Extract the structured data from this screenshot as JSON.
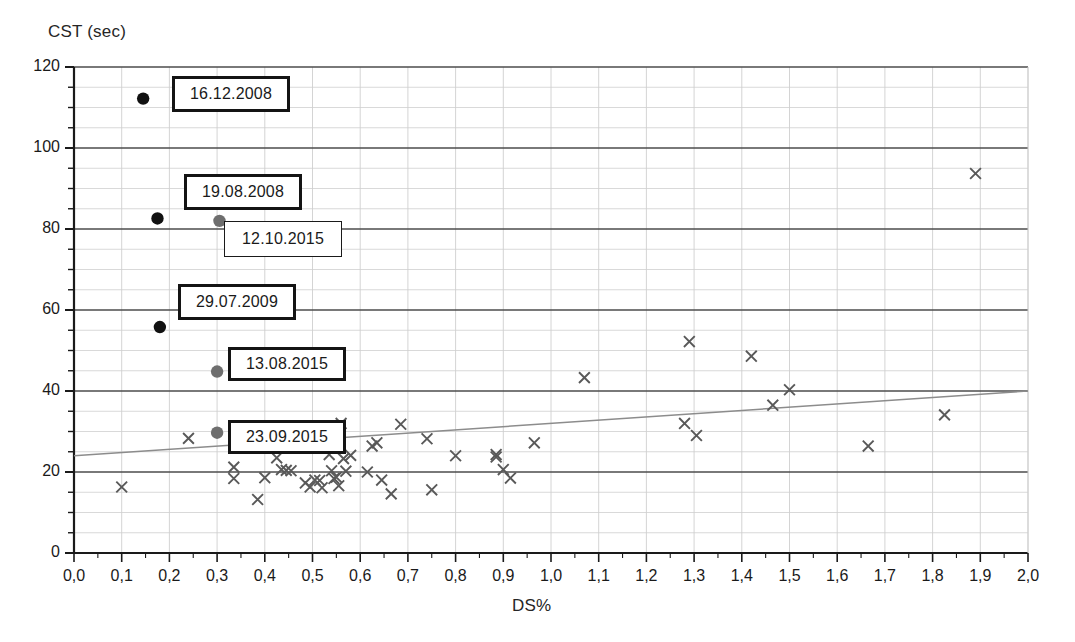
{
  "chart_data": {
    "type": "scatter",
    "title": "",
    "xlabel": "DS%",
    "ylabel": "CST (sec)",
    "xlim": [
      0.0,
      2.0
    ],
    "ylim": [
      0,
      120
    ],
    "x_major_step": 0.1,
    "y_major_step": 20,
    "y_minor_step": 5,
    "grid": true,
    "legend_position": "none",
    "xticks": [
      "0,0",
      "0,1",
      "0,2",
      "0,3",
      "0,4",
      "0,5",
      "0,6",
      "0,7",
      "0,8",
      "0,9",
      "1,0",
      "1,1",
      "1,2",
      "1,3",
      "1,4",
      "1,5",
      "1,6",
      "1,7",
      "1,8",
      "1,9",
      "2,0"
    ],
    "yticks": [
      "0",
      "20",
      "40",
      "60",
      "80",
      "100",
      "120"
    ],
    "series": [
      {
        "name": "measurements",
        "marker": "x",
        "color": "#595959",
        "points": [
          [
            0.1,
            16.3
          ],
          [
            0.24,
            28.3
          ],
          [
            0.335,
            21.2
          ],
          [
            0.335,
            18.4
          ],
          [
            0.385,
            13.2
          ],
          [
            0.4,
            18.6
          ],
          [
            0.425,
            23.5
          ],
          [
            0.435,
            20.6
          ],
          [
            0.445,
            20.4
          ],
          [
            0.455,
            20.3
          ],
          [
            0.485,
            17.3
          ],
          [
            0.495,
            16.3
          ],
          [
            0.505,
            18.0
          ],
          [
            0.515,
            17.9
          ],
          [
            0.52,
            16.1
          ],
          [
            0.535,
            24.3
          ],
          [
            0.54,
            20.3
          ],
          [
            0.545,
            18.4
          ],
          [
            0.55,
            18.7
          ],
          [
            0.555,
            16.6
          ],
          [
            0.56,
            32.0
          ],
          [
            0.565,
            23.3
          ],
          [
            0.57,
            20.2
          ],
          [
            0.58,
            24.1
          ],
          [
            0.615,
            20.0
          ],
          [
            0.625,
            26.4
          ],
          [
            0.635,
            27.2
          ],
          [
            0.645,
            18.0
          ],
          [
            0.665,
            14.6
          ],
          [
            0.685,
            31.8
          ],
          [
            0.74,
            28.2
          ],
          [
            0.75,
            15.6
          ],
          [
            0.8,
            24.0
          ],
          [
            0.885,
            24.3
          ],
          [
            0.885,
            23.7
          ],
          [
            0.9,
            20.6
          ],
          [
            0.915,
            18.5
          ],
          [
            0.965,
            27.2
          ],
          [
            1.07,
            43.3
          ],
          [
            1.28,
            32.0
          ],
          [
            1.305,
            29.0
          ],
          [
            1.29,
            52.2
          ],
          [
            1.42,
            48.6
          ],
          [
            1.465,
            36.5
          ],
          [
            1.5,
            40.3
          ],
          [
            1.665,
            26.4
          ],
          [
            1.825,
            34.1
          ],
          [
            1.89,
            93.7
          ]
        ]
      },
      {
        "name": "marked-black",
        "marker": "filled-circle",
        "color": "#111111",
        "points": [
          [
            0.145,
            112.2
          ],
          [
            0.175,
            82.6
          ],
          [
            0.18,
            55.8
          ]
        ]
      },
      {
        "name": "marked-gray",
        "marker": "filled-circle",
        "color": "#6e6e6e",
        "points": [
          [
            0.305,
            82.0
          ],
          [
            0.3,
            44.8
          ],
          [
            0.3,
            29.7
          ]
        ]
      }
    ],
    "trendline": {
      "name": "linear-trend",
      "color": "#8c8c8c",
      "x_start": 0.0,
      "y_start": 24.0,
      "x_end": 2.0,
      "y_end": 40.0
    },
    "annotations": [
      {
        "id": "a1",
        "label": "16.12.2008",
        "style": "thick",
        "x": 0.145,
        "y": 112.2
      },
      {
        "id": "a2",
        "label": "19.08.2008",
        "style": "thick",
        "x": 0.175,
        "y": 82.6
      },
      {
        "id": "a3",
        "label": "12.10.2015",
        "style": "thin",
        "x": 0.305,
        "y": 82.0
      },
      {
        "id": "a4",
        "label": "29.07.2009",
        "style": "thick",
        "x": 0.18,
        "y": 55.8
      },
      {
        "id": "a5",
        "label": "13.08.2015",
        "style": "thick",
        "x": 0.3,
        "y": 44.8
      },
      {
        "id": "a6",
        "label": "23.09.2015",
        "style": "thick",
        "x": 0.3,
        "y": 29.7
      }
    ]
  },
  "colors": {
    "axis": "#1a1a1a",
    "major_grid": "#4d4d4d",
    "minor_grid": "#cfcfcf",
    "marker": "#595959",
    "trend": "#8c8c8c",
    "callout_border": "#141414",
    "black_dot": "#111111",
    "gray_dot": "#6e6e6e"
  },
  "callout_boxes": [
    {
      "label": "16.12.2008",
      "style": "thick",
      "left": 172,
      "top": 76,
      "width": 118,
      "height": 36
    },
    {
      "label": "19.08.2008",
      "style": "thick",
      "left": 184,
      "top": 174,
      "width": 118,
      "height": 36
    },
    {
      "label": "12.10.2015",
      "style": "thin",
      "left": 224,
      "top": 221,
      "width": 118,
      "height": 36
    },
    {
      "label": "29.07.2009",
      "style": "thick",
      "left": 178,
      "top": 284,
      "width": 118,
      "height": 36
    },
    {
      "label": "13.08.2015",
      "style": "thick",
      "left": 228,
      "top": 347,
      "width": 118,
      "height": 34
    },
    {
      "label": "23.09.2015",
      "style": "thick",
      "left": 228,
      "top": 420,
      "width": 118,
      "height": 34
    }
  ]
}
